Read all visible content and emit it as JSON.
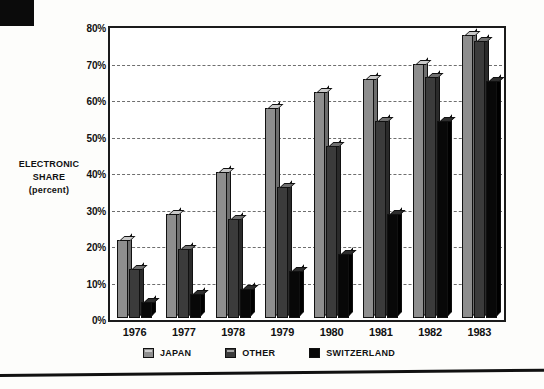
{
  "chart_data": {
    "type": "bar",
    "title": "",
    "xlabel": "",
    "ylabel": "ELECTRONIC SHARE (percent)",
    "ylim": [
      0,
      80
    ],
    "ytick_step": 10,
    "grid": true,
    "legend_position": "bottom",
    "categories": [
      "1976",
      "1977",
      "1978",
      "1979",
      "1980",
      "1981",
      "1982",
      "1983"
    ],
    "ytick_labels": [
      "0%",
      "10%",
      "20%",
      "30%",
      "40%",
      "50%",
      "60%",
      "70%",
      "80%"
    ],
    "ytick_values": [
      0,
      10,
      20,
      30,
      40,
      50,
      60,
      70,
      80
    ],
    "series": [
      {
        "name": "JAPAN",
        "color": "#8e8e8e",
        "values": [
          21.5,
          28.5,
          40.0,
          57.5,
          62.0,
          65.5,
          69.5,
          77.5
        ]
      },
      {
        "name": "OTHER",
        "color": "#3b3b3b",
        "values": [
          13.5,
          19.0,
          27.0,
          36.0,
          47.0,
          54.0,
          66.0,
          76.0
        ]
      },
      {
        "name": "SWITZERLAND",
        "color": "#080808",
        "values": [
          4.5,
          6.5,
          8.0,
          13.0,
          17.5,
          28.5,
          54.0,
          65.0
        ]
      }
    ]
  },
  "axis": {
    "y_title_line1": "ELECTRONIC",
    "y_title_line2": "SHARE",
    "y_title_line3": "(percent)"
  },
  "legend": {
    "items": [
      {
        "label": "JAPAN",
        "swatch": "swatch-japan"
      },
      {
        "label": "OTHER",
        "swatch": "swatch-other"
      },
      {
        "label": "SWITZERLAND",
        "swatch": "swatch-switzerland"
      }
    ]
  }
}
